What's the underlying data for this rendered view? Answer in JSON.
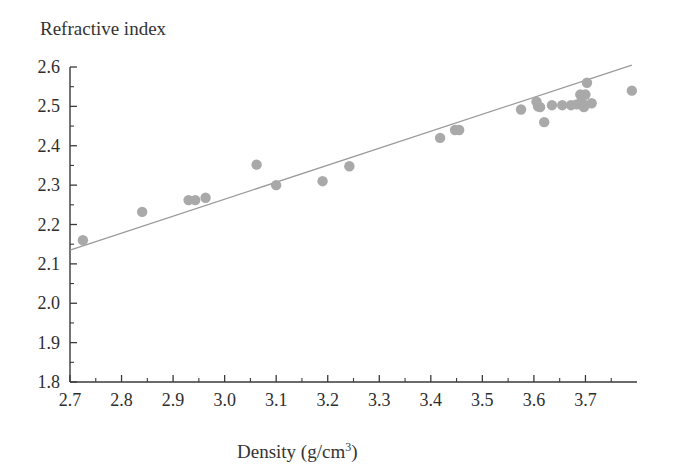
{
  "figure": {
    "y_axis_title": "Refractive index",
    "x_axis_title_main": "Density (g/cm",
    "x_axis_title_sup": "3",
    "x_axis_title_close": ")"
  },
  "axes": {
    "x_ticks": [
      "2.7",
      "2.8",
      "2.9",
      "3.0",
      "3.1",
      "3.2",
      "3.3",
      "3.4",
      "3.5",
      "3.6",
      "3.7"
    ],
    "y_ticks": [
      "1.8",
      "1.9",
      "2.0",
      "2.1",
      "2.2",
      "2.3",
      "2.4",
      "2.5",
      "2.6"
    ]
  },
  "colors": {
    "point": "#a9a9a9",
    "line": "#9a9a9a",
    "axis": "#3a3a3a",
    "text": "#2e2e2e",
    "background": "#ffffff"
  },
  "chart_data": {
    "type": "scatter",
    "title": "",
    "xlabel": "Density (g/cm3)",
    "ylabel": "Refractive index",
    "xlim": [
      2.7,
      3.8
    ],
    "ylim": [
      1.8,
      2.6
    ],
    "x_tick_values": [
      2.7,
      2.8,
      2.9,
      3.0,
      3.1,
      3.2,
      3.3,
      3.4,
      3.5,
      3.6,
      3.7
    ],
    "y_tick_values": [
      1.8,
      1.9,
      2.0,
      2.1,
      2.2,
      2.3,
      2.4,
      2.5,
      2.6
    ],
    "x_minor_tick_step": 0.05,
    "y_minor_tick_step": 0.05,
    "grid": false,
    "legend": false,
    "series": [
      {
        "name": "samples",
        "marker": "circle",
        "color": "#a9a9a9",
        "points": [
          [
            2.725,
            2.16
          ],
          [
            2.84,
            2.232
          ],
          [
            2.93,
            2.262
          ],
          [
            2.943,
            2.262
          ],
          [
            2.963,
            2.268
          ],
          [
            3.062,
            2.352
          ],
          [
            3.1,
            2.3
          ],
          [
            3.19,
            2.31
          ],
          [
            3.242,
            2.348
          ],
          [
            3.418,
            2.42
          ],
          [
            3.447,
            2.44
          ],
          [
            3.455,
            2.44
          ],
          [
            3.575,
            2.492
          ],
          [
            3.605,
            2.512
          ],
          [
            3.608,
            2.5
          ],
          [
            3.612,
            2.498
          ],
          [
            3.62,
            2.46
          ],
          [
            3.635,
            2.503
          ],
          [
            3.655,
            2.503
          ],
          [
            3.672,
            2.503
          ],
          [
            3.683,
            2.505
          ],
          [
            3.69,
            2.53
          ],
          [
            3.693,
            2.512
          ],
          [
            3.697,
            2.498
          ],
          [
            3.7,
            2.53
          ],
          [
            3.703,
            2.56
          ],
          [
            3.712,
            2.508
          ],
          [
            3.79,
            2.54
          ]
        ]
      }
    ],
    "fit_line": {
      "name": "linear fit",
      "color": "#9a9a9a",
      "x_start": 2.7,
      "y_start": 2.135,
      "x_end": 3.79,
      "y_end": 2.605,
      "slope": 0.431,
      "intercept": 0.971
    }
  }
}
